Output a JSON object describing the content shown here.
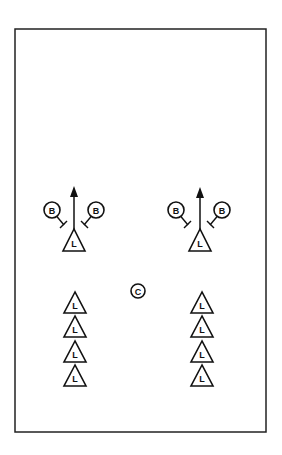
{
  "diagram": {
    "field": {
      "x": 15,
      "y": 29,
      "width": 251,
      "height": 403,
      "stroke": "#222222"
    },
    "coach": {
      "label": "C",
      "x": 138,
      "y": 291,
      "r": 7
    },
    "groups": [
      {
        "name": "left",
        "arrow": {
          "x": 74,
          "y1": 229,
          "y2": 186
        },
        "leader": {
          "label": "L",
          "x": 74,
          "apex_y": 229,
          "base_y": 251,
          "half_w": 11
        },
        "blockers": [
          {
            "label": "B",
            "x": 52,
            "y": 210,
            "r": 8,
            "bar": {
              "x1": 57,
              "y1": 217,
              "x2": 64,
              "y2": 225
            },
            "tick": {
              "x1": 60,
              "y1": 228,
              "x2": 67,
              "y2": 221
            }
          },
          {
            "label": "B",
            "x": 96,
            "y": 210,
            "r": 8,
            "bar": {
              "x1": 91,
              "y1": 217,
              "x2": 84,
              "y2": 225
            },
            "tick": {
              "x1": 88,
              "y1": 228,
              "x2": 81,
              "y2": 221
            }
          }
        ]
      },
      {
        "name": "right",
        "arrow": {
          "x": 200,
          "y1": 229,
          "y2": 187
        },
        "leader": {
          "label": "L",
          "x": 200,
          "apex_y": 229,
          "base_y": 251,
          "half_w": 11
        },
        "blockers": [
          {
            "label": "B",
            "x": 176,
            "y": 210,
            "r": 8,
            "bar": {
              "x1": 181,
              "y1": 217,
              "x2": 188,
              "y2": 225
            },
            "tick": {
              "x1": 184,
              "y1": 228,
              "x2": 191,
              "y2": 221
            }
          },
          {
            "label": "B",
            "x": 222,
            "y": 210,
            "r": 8,
            "bar": {
              "x1": 217,
              "y1": 217,
              "x2": 210,
              "y2": 225
            },
            "tick": {
              "x1": 214,
              "y1": 228,
              "x2": 207,
              "y2": 221
            }
          }
        ]
      }
    ],
    "lines": [
      {
        "name": "left-line",
        "x": 75,
        "label": "L",
        "apex_ys": [
          292,
          316,
          341,
          365
        ],
        "height": 21,
        "half_w": 11
      },
      {
        "name": "right-line",
        "x": 202,
        "label": "L",
        "apex_ys": [
          292,
          316,
          341,
          365
        ],
        "height": 21,
        "half_w": 11
      }
    ]
  }
}
